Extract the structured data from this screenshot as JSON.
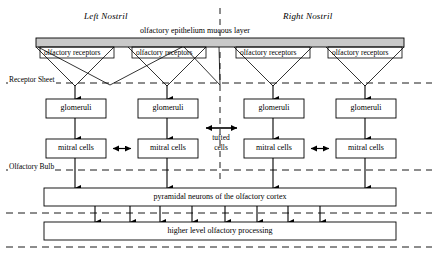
{
  "diagram": {
    "nostrils": [
      {
        "label": "Left Nostril"
      },
      {
        "label": "Right Nostril"
      }
    ],
    "mucous_layer": {
      "label": "olfactory epithelium mucous layer",
      "fill": "#c9c9c9",
      "stroke": "#000000"
    },
    "layer_labels": [
      {
        "label": "Receptor Sheet"
      },
      {
        "label": "Olfactory Bulb"
      }
    ],
    "receptor_boxes": [
      {
        "label": "olfactory receptors"
      },
      {
        "label": "olfactory receptors"
      },
      {
        "label": "olfactory receptors"
      },
      {
        "label": "olfactory receptors"
      }
    ],
    "glomeruli_boxes": [
      {
        "label": "glomeruli"
      },
      {
        "label": "glomeruli"
      },
      {
        "label": "glomeruli"
      },
      {
        "label": "glomeruli"
      }
    ],
    "mitral_boxes": [
      {
        "label": "mitral cells"
      },
      {
        "label": "mitral cells"
      },
      {
        "label": "mitral cells"
      },
      {
        "label": "mitral cells"
      }
    ],
    "tufted_cells": {
      "label_line1": "tufted",
      "label_line2": "cells"
    },
    "cortex_box": {
      "label": "pyramidal neurons of the olfactory cortex"
    },
    "higher_box": {
      "label": "higher level olfactory processing"
    },
    "colors": {
      "line": "#000000",
      "mucous_fill": "#c9c9c9",
      "background": "#ffffff"
    }
  }
}
